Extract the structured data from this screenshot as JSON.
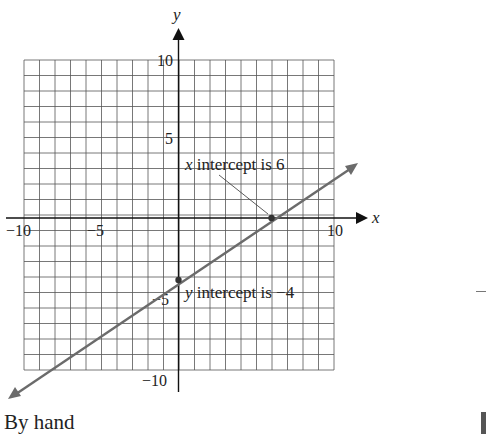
{
  "chart_data": {
    "type": "line",
    "title": "",
    "xlabel": "x",
    "ylabel": "y",
    "xlim": [
      -10,
      10
    ],
    "ylim": [
      -10,
      10
    ],
    "grid": true,
    "grid_step": 1,
    "x_ticks": [
      "−10",
      "−5",
      "10"
    ],
    "y_ticks": [
      "10",
      "5",
      "−5",
      "−10"
    ],
    "series": [
      {
        "name": "line",
        "equation": "y = (2/3)x − 4",
        "x": [
          -11,
          0,
          6,
          11.5
        ],
        "values": [
          -11.33,
          -4,
          0,
          3.67
        ],
        "color": "#6b6b6b"
      }
    ],
    "points": [
      {
        "x": 6,
        "y": 0,
        "label": "x intercept is 6"
      },
      {
        "x": 0,
        "y": -4,
        "label": "y intercept is −4"
      }
    ]
  },
  "annotations": {
    "x_intercept": "x intercept is 6",
    "x_intercept_var": "x",
    "x_intercept_rest": " intercept is 6",
    "y_intercept_var": "y",
    "y_intercept_rest": " intercept is −4"
  },
  "axes": {
    "x_name": "x",
    "y_name": "y",
    "tick_x_neg10": "−10",
    "tick_x_neg5": "−5",
    "tick_x_10": "10",
    "tick_y_10": "10",
    "tick_y_5": "5",
    "tick_y_neg5": "−5",
    "tick_y_neg10": "−10"
  },
  "caption": "By hand"
}
